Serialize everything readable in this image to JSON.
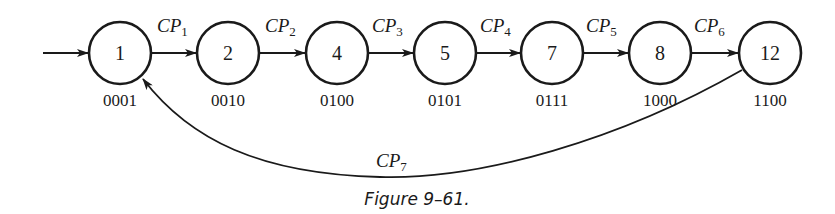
{
  "figure": {
    "caption": "Figure 9–61.",
    "entry_arrow": true,
    "states": [
      {
        "id": "1",
        "label": "1",
        "code": "0001",
        "cx": 120
      },
      {
        "id": "2",
        "label": "2",
        "code": "0010",
        "cx": 228
      },
      {
        "id": "4",
        "label": "4",
        "code": "0100",
        "cx": 337
      },
      {
        "id": "5",
        "label": "5",
        "code": "0101",
        "cx": 445
      },
      {
        "id": "7",
        "label": "7",
        "code": "0111",
        "cx": 552
      },
      {
        "id": "8",
        "label": "8",
        "code": "1000",
        "cx": 660
      },
      {
        "id": "12",
        "label": "12",
        "code": "1100",
        "cx": 770
      }
    ],
    "transitions": [
      {
        "from": "1",
        "to": "2",
        "label": "CP",
        "sub": "1"
      },
      {
        "from": "2",
        "to": "4",
        "label": "CP",
        "sub": "2"
      },
      {
        "from": "4",
        "to": "5",
        "label": "CP",
        "sub": "3"
      },
      {
        "from": "5",
        "to": "7",
        "label": "CP",
        "sub": "4"
      },
      {
        "from": "7",
        "to": "8",
        "label": "CP",
        "sub": "5"
      },
      {
        "from": "8",
        "to": "12",
        "label": "CP",
        "sub": "6"
      },
      {
        "from": "12",
        "to": "1",
        "label": "CP",
        "sub": "7"
      }
    ]
  }
}
